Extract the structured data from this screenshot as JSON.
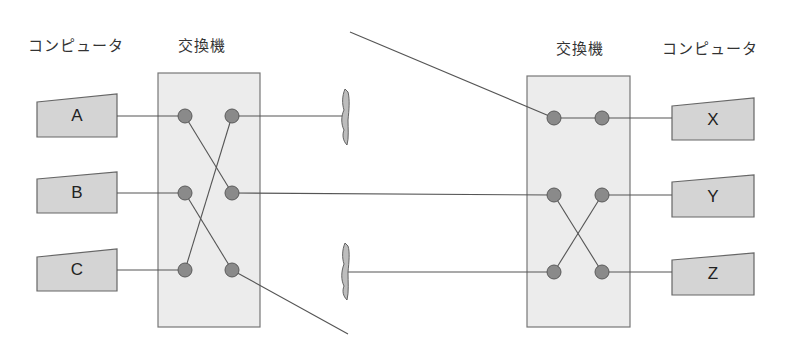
{
  "labels": {
    "left_computer_header": "コンピュータ",
    "left_switch_header": "交換機",
    "right_switch_header": "交換機",
    "right_computer_header": "コンピュータ"
  },
  "left_computers": [
    {
      "label": "A"
    },
    {
      "label": "B"
    },
    {
      "label": "C"
    }
  ],
  "right_computers": [
    {
      "label": "X"
    },
    {
      "label": "Y"
    },
    {
      "label": "Z"
    }
  ],
  "colors": {
    "switch_fill": "#ececec",
    "switch_border": "#777777",
    "computer_fill": "#d4d4d4",
    "node_fill": "#8a8a8a",
    "line": "#555555"
  },
  "connections": {
    "left_switch": [
      "A→B-side out (A in → right-middle)",
      "B in → right-bottom",
      "C in → right-top"
    ],
    "right_switch": [
      "top-left → X",
      "middle-left → Z",
      "bottom-left → Y"
    ]
  }
}
